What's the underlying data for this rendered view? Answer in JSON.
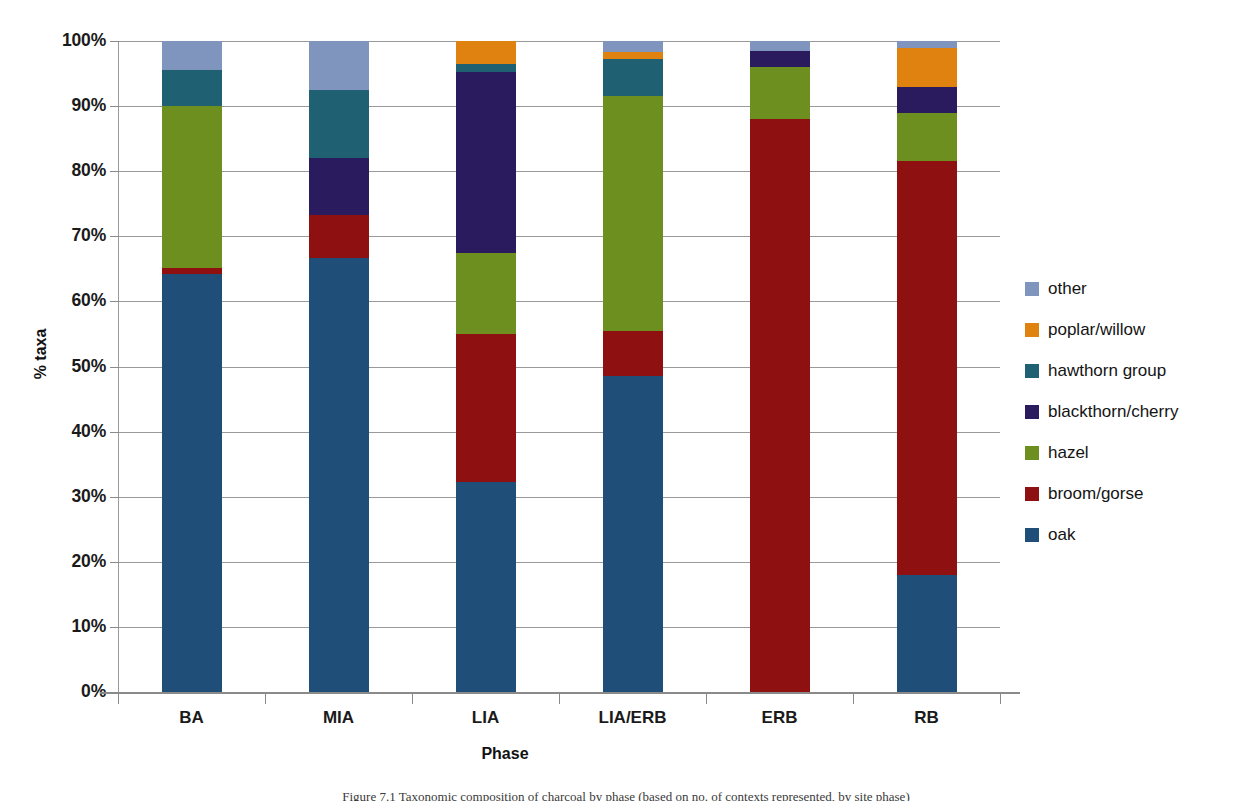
{
  "chart_data": {
    "type": "bar",
    "subtype": "stacked-percentage",
    "title": "",
    "xlabel": "Phase",
    "ylabel": "% taxa",
    "categories": [
      "BA",
      "MIA",
      "LIA",
      "LIA/ERB",
      "ERB",
      "RB"
    ],
    "ylim": [
      0,
      100
    ],
    "ytick_labels": [
      "0%",
      "10%",
      "20%",
      "30%",
      "40%",
      "50%",
      "60%",
      "70%",
      "80%",
      "90%",
      "100%"
    ],
    "ytick_values": [
      0,
      10,
      20,
      30,
      40,
      50,
      60,
      70,
      80,
      90,
      100
    ],
    "grid": true,
    "legend_position": "right",
    "stack_order_bottom_to_top": [
      "oak",
      "broom/gorse",
      "hazel",
      "blackthorn/cherry",
      "hawthorn group",
      "poplar/willow",
      "other"
    ],
    "series": [
      {
        "name": "oak",
        "color": "#1f4e79",
        "values": [
          64.2,
          66.7,
          32.3,
          48.6,
          0.0,
          17.9
        ]
      },
      {
        "name": "broom/gorse",
        "color": "#8e1010",
        "values": [
          1.0,
          6.5,
          22.7,
          6.9,
          88.0,
          63.6
        ]
      },
      {
        "name": "hazel",
        "color": "#6d8f1f",
        "values": [
          24.8,
          0.0,
          12.5,
          36.0,
          8.0,
          7.5
        ]
      },
      {
        "name": "blackthorn/cherry",
        "color": "#2a1a5e",
        "values": [
          0.0,
          8.8,
          27.7,
          0.0,
          2.5,
          4.0
        ]
      },
      {
        "name": "hawthorn group",
        "color": "#1f6073",
        "values": [
          5.5,
          10.5,
          1.3,
          5.8,
          0.0,
          0.0
        ]
      },
      {
        "name": "poplar/willow",
        "color": "#e0820f",
        "values": [
          0.0,
          0.0,
          3.5,
          1.0,
          0.0,
          6.0
        ]
      },
      {
        "name": "other",
        "color": "#7f95bd",
        "values": [
          4.5,
          7.5,
          0.0,
          1.7,
          1.5,
          1.0
        ]
      }
    ],
    "legend_entries": [
      {
        "label": "other",
        "color": "#7f95bd"
      },
      {
        "label": "poplar/willow",
        "color": "#e0820f"
      },
      {
        "label": "hawthorn group",
        "color": "#1f6073"
      },
      {
        "label": "blackthorn/cherry",
        "color": "#2a1a5e"
      },
      {
        "label": "hazel",
        "color": "#6d8f1f"
      },
      {
        "label": "broom/gorse",
        "color": "#8e1010"
      },
      {
        "label": "oak",
        "color": "#1f4e79"
      }
    ]
  },
  "caption": {
    "text": "Figure 7.1 Taxonomic composition of charcoal by phase (based on no. of contexts represented, by site phase)"
  }
}
